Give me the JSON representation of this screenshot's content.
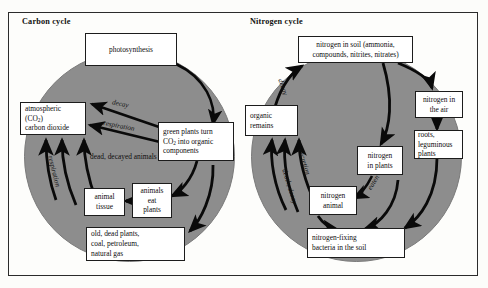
{
  "figure": {
    "background_color": "#fdfdfb",
    "disc_color": "#8d8d8d",
    "border_color": "#1c1c1c"
  },
  "panels": [
    {
      "id": "carbon",
      "title": "Carbon cycle",
      "boxes": {
        "photosynthesis": "photosynthesis",
        "atmospheric_l1": "atmospheric",
        "atmospheric_l2": "(CO",
        "atmospheric_l2_sub": "2",
        "atmospheric_l2_end": ")",
        "atmospheric_l3": "carbon dioxide",
        "green_plants_l1": "green plants turn",
        "green_plants_l2a": "CO",
        "green_plants_l2sub": "2",
        "green_plants_l2b": " into organic",
        "green_plants_l3": "components",
        "animal_tissue_l1": "animal",
        "animal_tissue_l2": "tissue",
        "animals_eat_l1": "animals",
        "animals_eat_l2": "eat",
        "animals_eat_l3": "plants",
        "fossil_l1": "old, dead plants,",
        "fossil_l2": "coal, petroleum,",
        "fossil_l3": "natural gas"
      },
      "free_labels": {
        "dead_decayed_l1": "dead,",
        "dead_decayed_l2": "decayed",
        "dead_decayed_l3": "animals"
      },
      "arrow_labels": {
        "decay": "decay",
        "respiration_upper": "respiration",
        "respiration_lower": "respiration"
      }
    },
    {
      "id": "nitrogen",
      "title": "Nitrogen cycle",
      "boxes": {
        "soil_l1": "nitrogen in soil (ammonia,",
        "soil_l2": "compounds, nitrites, nitrates)",
        "organic_remains_l1": "organic",
        "organic_remains_l2": "remains",
        "air_l1": "nitrogen in",
        "air_l2": "the air",
        "roots_l1": "roots,",
        "roots_l2": "leguminous",
        "roots_l3": "plants",
        "n_plants_l1": "nitrogen",
        "n_plants_l2": "in plants",
        "n_animal_l1": "nitrogen",
        "n_animal_l2": "animal",
        "bacteria_l1": "nitrogen-fixing",
        "bacteria_l2": "bacteria in the soil"
      },
      "arrow_labels": {
        "decay": "decay",
        "excretion": "excretion",
        "death_decay": "death, decay",
        "eaten": "eaten"
      }
    }
  ]
}
